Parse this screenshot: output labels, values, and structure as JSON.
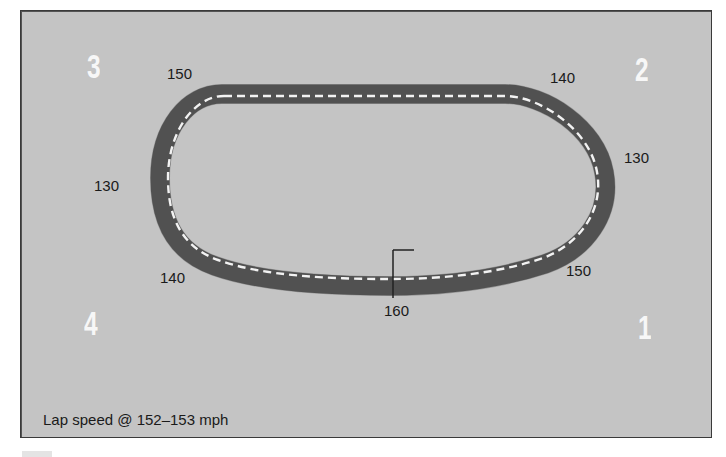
{
  "diagram": {
    "colors": {
      "background": "#c4c4c4",
      "track": "#555555",
      "centerline": "#f2f2f2",
      "turn_numbers": "#f7f7f7",
      "text": "#1a1a1a",
      "border": "#3a3a3a"
    },
    "turns": [
      {
        "id": "1",
        "label": "1"
      },
      {
        "id": "2",
        "label": "2"
      },
      {
        "id": "3",
        "label": "3"
      },
      {
        "id": "4",
        "label": "4"
      }
    ],
    "speed_labels": [
      {
        "position": "top-left",
        "value": "150"
      },
      {
        "position": "top-right",
        "value": "140"
      },
      {
        "position": "right",
        "value": "130"
      },
      {
        "position": "bottom-right",
        "value": "150"
      },
      {
        "position": "start-finish",
        "value": "160"
      },
      {
        "position": "bottom-left",
        "value": "140"
      },
      {
        "position": "left",
        "value": "130"
      }
    ],
    "caption": "Lap speed @ 152–153 mph"
  }
}
